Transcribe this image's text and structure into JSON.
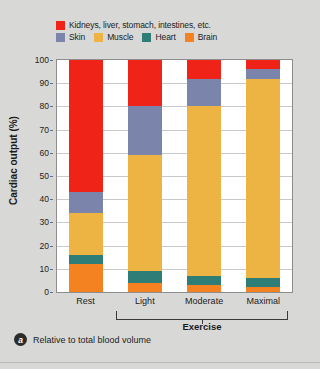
{
  "legend": {
    "items": [
      {
        "label": "Kidneys, liver, stomach, intestines, etc.",
        "color": "#ef2318",
        "key": "kidneys"
      },
      {
        "label": "Skin",
        "color": "#7b85ab",
        "key": "skin"
      },
      {
        "label": "Muscle",
        "color": "#eeb443",
        "key": "muscle"
      },
      {
        "label": "Heart",
        "color": "#2e7d76",
        "key": "heart"
      },
      {
        "label": "Brain",
        "color": "#f58220",
        "key": "brain"
      }
    ]
  },
  "axes": {
    "ylabel": "Cardiac output (%)",
    "yticks": [
      "100",
      "90",
      "80",
      "70",
      "60",
      "50",
      "40",
      "30",
      "20",
      "10",
      "0"
    ],
    "group_label": "Exercise"
  },
  "caption": {
    "badge": "a",
    "text": "Relative to total blood volume"
  },
  "chart_data": {
    "type": "bar",
    "stacked": true,
    "title": "",
    "xlabel": "",
    "ylabel": "Cardiac output (%)",
    "ylim": [
      0,
      100
    ],
    "ytick_step": 10,
    "grid": true,
    "legend_position": "top",
    "categories": [
      "Rest",
      "Light",
      "Moderate",
      "Maximal"
    ],
    "group_bracket": {
      "label": "Exercise",
      "covers": [
        "Light",
        "Moderate",
        "Maximal"
      ]
    },
    "series": [
      {
        "name": "Brain",
        "color": "#f58220",
        "values": [
          12,
          4,
          3,
          2
        ]
      },
      {
        "name": "Heart",
        "color": "#2e7d76",
        "values": [
          4,
          5,
          4,
          4
        ]
      },
      {
        "name": "Muscle",
        "color": "#eeb443",
        "values": [
          18,
          50,
          73,
          86
        ]
      },
      {
        "name": "Skin",
        "color": "#7b85ab",
        "values": [
          9,
          21,
          12,
          4
        ]
      },
      {
        "name": "Kidneys, liver, stomach, intestines, etc.",
        "color": "#ef2318",
        "values": [
          57,
          20,
          8,
          4
        ]
      }
    ]
  }
}
